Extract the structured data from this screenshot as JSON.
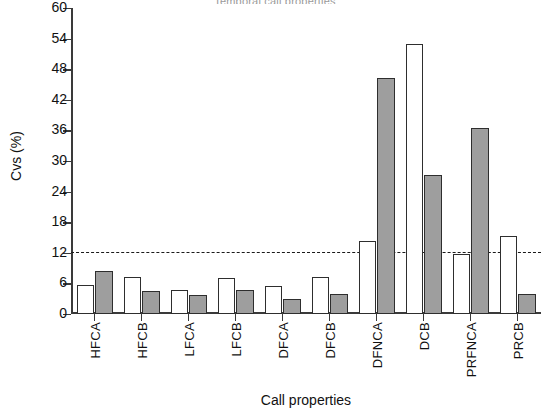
{
  "chart_data": {
    "type": "bar",
    "title": "Temporal call properties",
    "xlabel": "Call properties",
    "ylabel": "Cvs (%)",
    "ylim": [
      0,
      60
    ],
    "ytick_step": 6,
    "ytick_labels": [
      "0",
      "6",
      "12",
      "18",
      "24",
      "30",
      "36",
      "42",
      "48",
      "54",
      "60"
    ],
    "grid": false,
    "legend": null,
    "categories": [
      "HFCA",
      "HFCB",
      "LFCA",
      "LFCB",
      "DFCA",
      "DFCB",
      "DFNCA",
      "DCB",
      "PRFNCA",
      "PRCB"
    ],
    "series": [
      {
        "name": "white",
        "fill": "#ffffff",
        "values": [
          5.7,
          7.3,
          4.7,
          7.0,
          5.5,
          7.3,
          14.3,
          53.0,
          11.8,
          15.2
        ]
      },
      {
        "name": "gray",
        "fill": "#9e9e9e",
        "values": [
          8.5,
          4.6,
          3.7,
          4.7,
          3.0,
          4.0,
          46.3,
          27.2,
          36.4,
          3.9
        ]
      }
    ],
    "annotations": [
      {
        "type": "hline",
        "value": 12,
        "style": "dashed",
        "color": "#1a1a1a"
      }
    ]
  }
}
